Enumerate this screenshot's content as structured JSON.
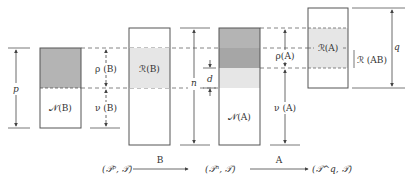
{
  "diagram": {
    "labels": {
      "p": "p",
      "n": "n",
      "q": "q",
      "d": "d",
      "null_B": "𝒩(B)",
      "rho_B": "ρ (B)",
      "nu_B": "ν (B)",
      "range_B": "ℛ(B)",
      "null_A": "𝒩(A)",
      "rho_A": "ρ(A)",
      "nu_A": "ν (A)",
      "range_A": "ℛ(A)",
      "range_AB": "ℛ (AB)"
    },
    "mapping": {
      "space_p": "(𝒯ᵖ, 𝒯)",
      "space_n": "(𝒯ⁿ, 𝒯)",
      "space_q": "(𝒯^q, 𝒯)",
      "arrow_B": "B",
      "arrow_A": "A"
    },
    "colors": {
      "dark_gray": "#b4b4b4",
      "darker_gray": "#a6a6a6",
      "light_gray": "#e6e6e6",
      "line": "#555555"
    }
  }
}
